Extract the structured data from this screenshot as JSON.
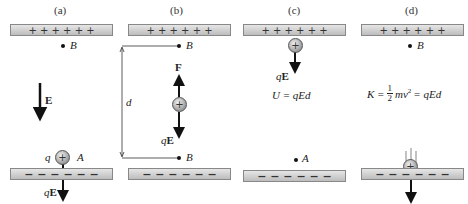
{
  "panels": {
    "a": {
      "label": "(a)",
      "plate_top": "+ + + + + +",
      "plate_bottom": "− − − − − −",
      "point_top": "B",
      "point_bottom": "A",
      "field": "E",
      "charge_label": "q",
      "charge_sign": "+",
      "force": "qE"
    },
    "b": {
      "label": "(b)",
      "plate_top": "+ + + + + +",
      "plate_bottom": "− − − − − −",
      "point_top": "B",
      "point_bottom": "A",
      "distance": "d",
      "force_up": "F",
      "charge_sign": "+",
      "force_down": "qE"
    },
    "c": {
      "label": "(c)",
      "plate_top": "+ + + + + +",
      "plate_bottom": "− − − − − −",
      "charge_sign": "+",
      "force": "qE",
      "equation": "U = qEd",
      "point_bottom": "A"
    },
    "d": {
      "label": "(d)",
      "plate_top": "+ + + + + +",
      "plate_bottom": "− − − − − −",
      "point_top": "B",
      "equation_left": "K =",
      "fraction_num": "1",
      "fraction_den": "2",
      "equation_mid": "mv",
      "exponent": "2",
      "equation_right": "= qEd",
      "charge_sign": "+"
    }
  }
}
